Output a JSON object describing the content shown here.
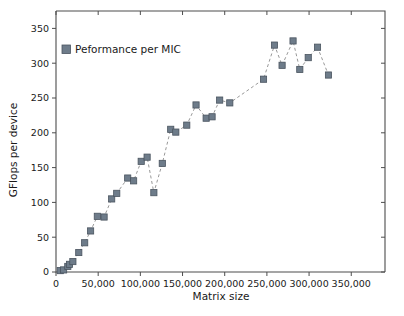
{
  "chart_data": {
    "type": "scatter",
    "title": "",
    "xlabel": "Matrix size",
    "ylabel": "GFlops per device",
    "xlim": [
      0,
      390000
    ],
    "ylim": [
      0,
      375
    ],
    "grid": false,
    "legend_position": "top-left",
    "marker_style": "square",
    "line_style": "dashed",
    "series": [
      {
        "name": "Peformance per MIC",
        "color": "#6e7c8a",
        "points": [
          [
            5000,
            2
          ],
          [
            9000,
            3
          ],
          [
            14000,
            8
          ],
          [
            16000,
            11
          ],
          [
            20000,
            15
          ],
          [
            27000,
            28
          ],
          [
            34000,
            42
          ],
          [
            41000,
            59
          ],
          [
            49000,
            80
          ],
          [
            57000,
            79
          ],
          [
            66000,
            105
          ],
          [
            72000,
            113
          ],
          [
            85000,
            135
          ],
          [
            92000,
            131
          ],
          [
            101000,
            159
          ],
          [
            108000,
            165
          ],
          [
            116000,
            114
          ],
          [
            126000,
            156
          ],
          [
            136000,
            205
          ],
          [
            142000,
            201
          ],
          [
            155000,
            211
          ],
          [
            166000,
            240
          ],
          [
            178000,
            221
          ],
          [
            185000,
            223
          ],
          [
            194000,
            247
          ],
          [
            206000,
            243
          ],
          [
            246000,
            277
          ],
          [
            259000,
            326
          ],
          [
            268000,
            297
          ],
          [
            281000,
            332
          ],
          [
            289000,
            291
          ],
          [
            299000,
            308
          ],
          [
            310000,
            323
          ],
          [
            323000,
            283
          ]
        ]
      }
    ],
    "xticks": [
      {
        "value": 0,
        "label": "0"
      },
      {
        "value": 50000,
        "label": "50,000"
      },
      {
        "value": 100000,
        "label": "100,000"
      },
      {
        "value": 150000,
        "label": "150,000"
      },
      {
        "value": 200000,
        "label": "200,000"
      },
      {
        "value": 250000,
        "label": "250,000"
      },
      {
        "value": 300000,
        "label": "300,000"
      },
      {
        "value": 350000,
        "label": "350,000"
      }
    ],
    "yticks": [
      {
        "value": 0,
        "label": "0"
      },
      {
        "value": 50,
        "label": "50"
      },
      {
        "value": 100,
        "label": "100"
      },
      {
        "value": 150,
        "label": "150"
      },
      {
        "value": 200,
        "label": "200"
      },
      {
        "value": 250,
        "label": "250"
      },
      {
        "value": 300,
        "label": "300"
      },
      {
        "value": 350,
        "label": "350"
      }
    ],
    "legend": [
      {
        "label": "Peformance per MIC",
        "color": "#6e7c8a"
      }
    ]
  }
}
